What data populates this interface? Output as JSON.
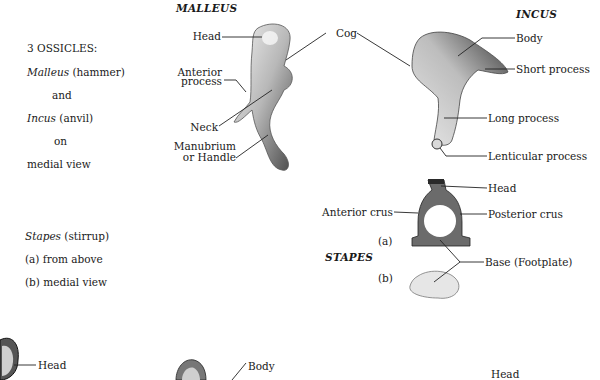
{
  "legend": {
    "heading": "3 OSSICLES:",
    "line1_italic": "Malleus",
    "line1_rest": " (hammer)",
    "line2": "and",
    "line3_italic": "Incus",
    "line3_rest": " (anvil)",
    "line4": "on",
    "line5": "medial view",
    "stapes_italic": "Stapes",
    "stapes_rest": " (stirrup)",
    "view_a": "(a)  from above",
    "view_b": "(b)  medial view"
  },
  "malleus": {
    "title": "MALLEUS",
    "labels": {
      "head": "Head",
      "anterior_process_1": "Anterior",
      "anterior_process_2": "process",
      "neck": "Neck",
      "manubrium_1": "Manubrium",
      "manubrium_2": "or Handle"
    }
  },
  "cog": {
    "label": "Cog"
  },
  "incus": {
    "title": "INCUS",
    "labels": {
      "body": "Body",
      "short_process": "Short process",
      "long_process": "Long process",
      "lenticular_process": "Lenticular process"
    }
  },
  "stapes": {
    "title": "STAPES",
    "labels": {
      "head": "Head",
      "anterior_crus": "Anterior crus",
      "posterior_crus": "Posterior crus",
      "base": "Base (Footplate)",
      "view_a": "(a)",
      "view_b": "(b)"
    }
  },
  "bottom_row": {
    "head_left": "Head",
    "body_mid": "Body",
    "head_right": "Head"
  }
}
